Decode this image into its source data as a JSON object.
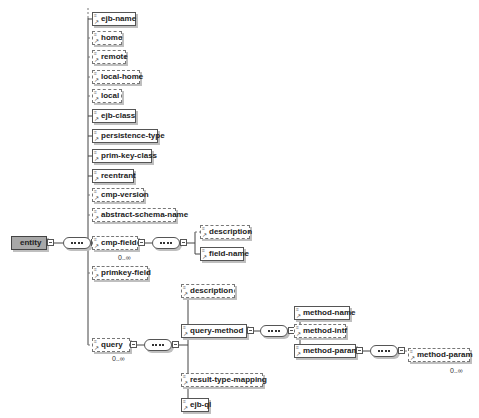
{
  "diagram": {
    "root": {
      "label": "entity"
    },
    "entity_children": [
      {
        "label": "ejb-name",
        "optional": false
      },
      {
        "label": "home",
        "optional": true
      },
      {
        "label": "remote",
        "optional": true
      },
      {
        "label": "local-home",
        "optional": true
      },
      {
        "label": "local",
        "optional": true
      },
      {
        "label": "ejb-class",
        "optional": false
      },
      {
        "label": "persistence-type",
        "optional": false
      },
      {
        "label": "prim-key-class",
        "optional": false
      },
      {
        "label": "reentrant",
        "optional": false
      },
      {
        "label": "cmp-version",
        "optional": true
      },
      {
        "label": "abstract-schema-name",
        "optional": true
      },
      {
        "label": "cmp-field",
        "optional": true,
        "cardinality": "0..∞"
      },
      {
        "label": "primkey-field",
        "optional": true
      },
      {
        "label": "query",
        "optional": true,
        "cardinality": "0..∞"
      }
    ],
    "cmp_field_children": [
      {
        "label": "description",
        "optional": true
      },
      {
        "label": "field-name",
        "optional": false
      }
    ],
    "query_children": [
      {
        "label": "description",
        "optional": true
      },
      {
        "label": "query-method",
        "optional": false
      },
      {
        "label": "result-type-mapping",
        "optional": true
      },
      {
        "label": "ejb-ql",
        "optional": false
      }
    ],
    "query_method_children": [
      {
        "label": "method-name",
        "optional": false
      },
      {
        "label": "method-intf",
        "optional": true
      },
      {
        "label": "method-params",
        "optional": false
      }
    ],
    "method_params_children": [
      {
        "label": "method-param",
        "optional": true,
        "cardinality": "0..∞"
      }
    ]
  }
}
